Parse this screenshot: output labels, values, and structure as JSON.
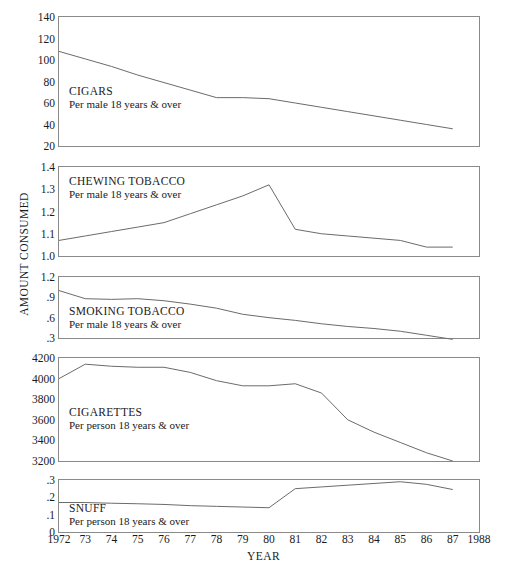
{
  "figure": {
    "y_axis_title": "AMOUNT CONSUMED",
    "x_axis_title": "YEAR"
  },
  "chart_data": {
    "type": "line",
    "title": "",
    "xlabel": "YEAR",
    "ylabel": "AMOUNT CONSUMED",
    "xlim": [
      1972,
      1988
    ],
    "x_ticks": [
      1972,
      1973,
      1974,
      1975,
      1976,
      1977,
      1978,
      1979,
      1980,
      1981,
      1982,
      1983,
      1984,
      1985,
      1986,
      1987,
      1988
    ],
    "x_tick_labels": [
      "1972",
      "73",
      "74",
      "75",
      "76",
      "77",
      "78",
      "79",
      "80",
      "81",
      "82",
      "83",
      "84",
      "85",
      "86",
      "87",
      "1988"
    ],
    "grid": false,
    "legend": "none",
    "line_color": "#6b6b6b",
    "panels": [
      {
        "name": "cigars",
        "label": "CIGARS",
        "sublabel": "Per male 18 years & over",
        "ylim": [
          20,
          140
        ],
        "y_ticks": [
          20,
          40,
          60,
          80,
          100,
          120,
          140
        ],
        "y_tick_labels": [
          "20",
          "40",
          "60",
          "80",
          "100",
          "120",
          "140"
        ],
        "x": [
          1972,
          1973,
          1974,
          1975,
          1976,
          1977,
          1978,
          1979,
          1980,
          1981,
          1982,
          1983,
          1984,
          1985,
          1986,
          1987
        ],
        "values": [
          108,
          101,
          94,
          86,
          79,
          72,
          65,
          65,
          64,
          60,
          56,
          52,
          48,
          44,
          40,
          36
        ]
      },
      {
        "name": "chewing-tobacco",
        "label": "CHEWING TOBACCO",
        "sublabel": "Per male 18 years & over",
        "ylim": [
          1.0,
          1.4
        ],
        "y_ticks": [
          1.0,
          1.1,
          1.2,
          1.3,
          1.4
        ],
        "y_tick_labels": [
          "1.0",
          "1.1",
          "1.2",
          "1.3",
          "1.4"
        ],
        "x": [
          1972,
          1973,
          1974,
          1975,
          1976,
          1977,
          1978,
          1979,
          1980,
          1981,
          1982,
          1983,
          1984,
          1985,
          1986,
          1987
        ],
        "values": [
          1.07,
          1.09,
          1.11,
          1.13,
          1.15,
          1.19,
          1.23,
          1.27,
          1.32,
          1.12,
          1.1,
          1.09,
          1.08,
          1.07,
          1.04,
          1.04
        ]
      },
      {
        "name": "smoking-tobacco",
        "label": "SMOKING TOBACCO",
        "sublabel": "Per male 18 years & over",
        "ylim": [
          0.3,
          1.2
        ],
        "y_ticks": [
          0.3,
          0.6,
          0.9,
          1.2
        ],
        "y_tick_labels": [
          ".3",
          ".6",
          ".9",
          "1.2"
        ],
        "x": [
          1972,
          1973,
          1974,
          1975,
          1976,
          1977,
          1978,
          1979,
          1980,
          1981,
          1982,
          1983,
          1984,
          1985,
          1986,
          1987
        ],
        "values": [
          1.0,
          0.88,
          0.87,
          0.88,
          0.85,
          0.8,
          0.74,
          0.65,
          0.6,
          0.56,
          0.51,
          0.47,
          0.44,
          0.4,
          0.34,
          0.28
        ]
      },
      {
        "name": "cigarettes",
        "label": "CIGARETTES",
        "sublabel": "Per person 18 years & over",
        "ylim": [
          3200,
          4200
        ],
        "y_ticks": [
          3200,
          3400,
          3600,
          3800,
          4000,
          4200
        ],
        "y_tick_labels": [
          "3200",
          "3400",
          "3600",
          "3800",
          "4000",
          "4200"
        ],
        "x": [
          1972,
          1973,
          1974,
          1975,
          1976,
          1977,
          1978,
          1979,
          1980,
          1981,
          1982,
          1983,
          1984,
          1985,
          1986,
          1987
        ],
        "values": [
          4000,
          4140,
          4120,
          4110,
          4110,
          4060,
          3980,
          3930,
          3930,
          3950,
          3860,
          3600,
          3480,
          3380,
          3280,
          3200
        ]
      },
      {
        "name": "snuff",
        "label": "SNUFF",
        "sublabel": "Per person 18 years & over",
        "ylim": [
          0,
          0.3
        ],
        "y_ticks": [
          0,
          0.1,
          0.2,
          0.3
        ],
        "y_tick_labels": [
          "0",
          ".1",
          ".2",
          ".3"
        ],
        "x": [
          1972,
          1973,
          1974,
          1975,
          1976,
          1977,
          1978,
          1979,
          1980,
          1981,
          1982,
          1983,
          1984,
          1985,
          1986,
          1987
        ],
        "values": [
          0.17,
          0.17,
          0.166,
          0.163,
          0.159,
          0.152,
          0.148,
          0.144,
          0.14,
          0.25,
          0.26,
          0.27,
          0.28,
          0.29,
          0.275,
          0.245
        ]
      }
    ]
  }
}
